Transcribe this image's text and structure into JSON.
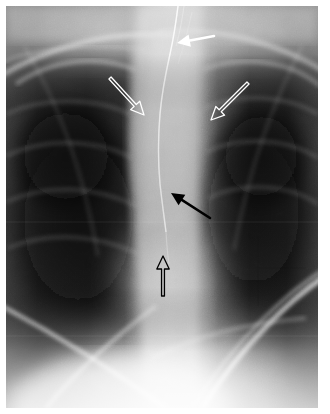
{
  "figure": {
    "modality": "chest-radiograph",
    "view": "frontal-pa-coned-view",
    "caption": "",
    "background_color": "#ffffff",
    "frame": {
      "x": 6,
      "y": 6,
      "width": 312,
      "height": 402
    }
  },
  "image_tones": {
    "lung_dark": "#1b1b1b",
    "lung_mid": "#3a3a3a",
    "soft_tissue_mid": "#8e8e8e",
    "mediastinum_bright": "#c9c9c9",
    "diaphragm_bright": "#ededed",
    "apex_gray": "#9a9a9a",
    "border": "#ffffff"
  },
  "annotations": [
    {
      "id": "a1",
      "name": "white-solid-arrow-tube-upper",
      "style": "solid",
      "color": "#ffffff",
      "outline_color": "#ffffff",
      "label": "",
      "direction": "left",
      "tail": {
        "x": 214,
        "y": 36
      },
      "tip": {
        "x": 177,
        "y": 43
      },
      "points_to": "upper-course-of-linear-catheter"
    },
    {
      "id": "a2",
      "name": "white-open-arrow-right-mediastinal-border",
      "style": "open",
      "color": "#ffffff",
      "outline_color": "#ffffff",
      "label": "",
      "direction": "down-right",
      "tail": {
        "x": 110,
        "y": 78
      },
      "tip": {
        "x": 144,
        "y": 115
      },
      "points_to": "right-paratracheal-mediastinal-stripe"
    },
    {
      "id": "a3",
      "name": "white-open-arrow-left-mediastinal-border",
      "style": "open",
      "color": "#ffffff",
      "outline_color": "#ffffff",
      "label": "",
      "direction": "down-left",
      "tail": {
        "x": 248,
        "y": 83
      },
      "tip": {
        "x": 211,
        "y": 120
      },
      "points_to": "left-mediastinal-stripe"
    },
    {
      "id": "a4",
      "name": "black-solid-arrow-tube-midline",
      "style": "solid",
      "color": "#000000",
      "outline_color": "#000000",
      "label": "",
      "direction": "up-left",
      "tail": {
        "x": 210,
        "y": 218
      },
      "tip": {
        "x": 171,
        "y": 193
      },
      "points_to": "mid-course-of-linear-catheter"
    },
    {
      "id": "a5",
      "name": "black-open-arrow-tube-tip-inferior",
      "style": "open",
      "color": "#000000",
      "outline_color": "#000000",
      "label": "",
      "direction": "up",
      "tail": {
        "x": 163,
        "y": 296
      },
      "tip": {
        "x": 163,
        "y": 256
      },
      "points_to": "inferior-tip-of-catheter"
    }
  ],
  "anatomy_features": [
    {
      "name": "right-lung-field",
      "tone": "dark",
      "side": "left-of-image"
    },
    {
      "name": "left-lung-field",
      "tone": "dark",
      "side": "right-of-image"
    },
    {
      "name": "mediastinum",
      "tone": "bright",
      "side": "midline"
    },
    {
      "name": "linear-catheter-tube",
      "tone": "bright-thin-line",
      "side": "midline"
    },
    {
      "name": "right-hemidiaphragm",
      "tone": "bright",
      "side": "lower"
    },
    {
      "name": "posterior-rib-arc",
      "tone": "bright-line",
      "side": "lower-left"
    },
    {
      "name": "left-hemidiaphragm",
      "tone": "bright",
      "side": "lower-right"
    },
    {
      "name": "clavicle-first-rib",
      "tone": "bright-line",
      "side": "upper"
    }
  ]
}
